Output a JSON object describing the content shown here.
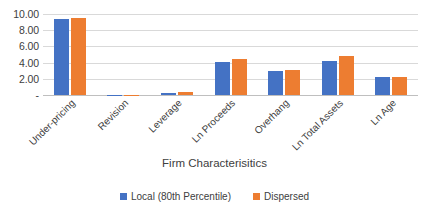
{
  "chart_data": {
    "type": "bar",
    "title": "",
    "subtitle": "",
    "xlabel": "Firm Characterisitics",
    "ylabel": "",
    "categories": [
      "Under-pricing",
      "Revision",
      "Leverage",
      "Ln Proceeds",
      "Overhang",
      "Ln Total Assets",
      "Ln Age"
    ],
    "series": [
      {
        "name": "Local (80th Percentile)",
        "color": "#4472C4",
        "values": [
          9.4,
          0.02,
          0.3,
          4.05,
          3.0,
          4.25,
          2.2
        ]
      },
      {
        "name": "Dispersed",
        "color": "#ED7D31",
        "values": [
          9.55,
          0.02,
          0.32,
          4.5,
          3.1,
          4.85,
          2.25
        ]
      }
    ],
    "ylim": [
      0,
      10
    ],
    "yticks": [
      0,
      2,
      4,
      6,
      8,
      10
    ],
    "ytick_labels": [
      "-",
      "2.00",
      "4.00",
      "6.00",
      "8.00",
      "10.00"
    ],
    "grid": true,
    "grid_axis": "y",
    "legend_position": "bottom",
    "bar_group_gap": true
  }
}
